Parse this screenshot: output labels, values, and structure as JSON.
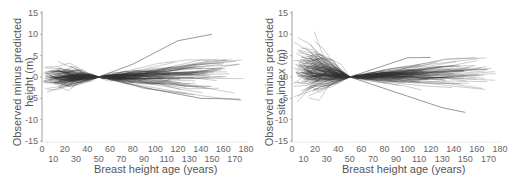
{
  "chart_data": [
    {
      "type": "line",
      "title": "",
      "ylabel_lines": [
        "Observed minus predicted",
        "height (m)"
      ],
      "xlabel": "Breast height age (years)",
      "xlim": [
        0,
        180
      ],
      "ylim": [
        -15,
        15
      ],
      "xticks_upper": [
        0,
        20,
        40,
        60,
        80,
        100,
        120,
        140,
        160,
        180
      ],
      "xticks_lower": [
        10,
        30,
        50,
        70,
        90,
        110,
        130,
        150,
        170
      ],
      "yticks": [
        15,
        10,
        5,
        0,
        -5,
        -10,
        -15
      ],
      "grid": false,
      "legend": null,
      "pivot_age": 50,
      "series_description": "Many individual tree trajectories (gray lines) converging to 0 at age 50",
      "envelope": {
        "before_pivot": {
          "x": [
            0,
            50
          ],
          "max_abs_at_x0": 3,
          "outliers": [
            5,
            -6
          ]
        },
        "after_pivot": {
          "x": [
            50,
            180
          ],
          "upper_max": 10,
          "upper_max_at": 150,
          "lower_min": -5.5
        }
      },
      "highlighted_series": [
        {
          "name": "max trajectory",
          "x": [
            50,
            80,
            120,
            150
          ],
          "y": [
            0,
            3,
            8.5,
            10
          ]
        },
        {
          "name": "min trajectory",
          "x": [
            50,
            100,
            140,
            175
          ],
          "y": [
            0,
            -3,
            -5,
            -5.2
          ]
        }
      ]
    },
    {
      "type": "line",
      "title": "",
      "ylabel_lines": [
        "Observed minus predicted",
        "site index (m)"
      ],
      "xlabel": "Breast height age (years)",
      "xlim": [
        0,
        180
      ],
      "ylim": [
        -15,
        15
      ],
      "xticks_upper": [
        0,
        20,
        40,
        60,
        80,
        100,
        120,
        140,
        160,
        180
      ],
      "xticks_lower": [
        10,
        30,
        50,
        70,
        90,
        110,
        130,
        150,
        170
      ],
      "yticks": [
        15,
        10,
        5,
        0,
        -5,
        -10,
        -15
      ],
      "grid": false,
      "legend": null,
      "pivot_age": 50,
      "series_description": "Many individual tree trajectories (gray lines) converging to 0 at age 50",
      "envelope": {
        "before_pivot": {
          "x": [
            0,
            50
          ],
          "upper_at_x0": 12.5,
          "lower_at_x0": -8.5
        },
        "after_pivot": {
          "x": [
            50,
            180
          ],
          "upper_max": 4.5,
          "lower_min": -8.3
        }
      },
      "highlighted_series": [
        {
          "name": "max trajectory",
          "x": [
            50,
            100,
            120
          ],
          "y": [
            0,
            4.5,
            4.6
          ]
        },
        {
          "name": "min trajectory",
          "x": [
            50,
            100,
            130,
            150
          ],
          "y": [
            0,
            -4.5,
            -7.2,
            -8.3
          ]
        }
      ]
    }
  ]
}
